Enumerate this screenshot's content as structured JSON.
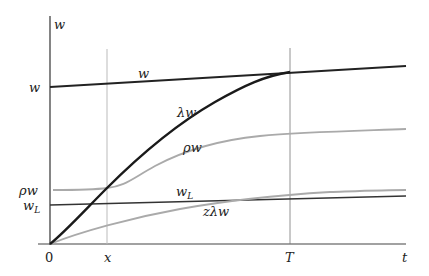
{
  "diagram": {
    "type": "wage-path diagram",
    "axes": {
      "y_axis_label": "w",
      "x_axis_label": "t",
      "origin_label": "0"
    },
    "x_ticks": [
      {
        "label": "x",
        "x": 107
      },
      {
        "label": "T",
        "x": 290
      }
    ],
    "y_ticks": [
      {
        "label": "w",
        "y": 87
      },
      {
        "label": "ρw",
        "y": 190
      },
      {
        "label": "w",
        "sub": "L",
        "y": 205
      }
    ],
    "curves": [
      {
        "name": "w",
        "label": "w",
        "color": "#222222",
        "style": "thick"
      },
      {
        "name": "lambda-w",
        "label": "λw",
        "color": "#1a1a1a",
        "style": "thick"
      },
      {
        "name": "rho-w",
        "label": "ρw",
        "color": "#aaaaaa",
        "style": "thin"
      },
      {
        "name": "w-L",
        "label": "w",
        "sub": "L",
        "color": "#333333",
        "style": "thin"
      },
      {
        "name": "z-lambda-w",
        "label": "zλw",
        "color": "#aaaaaa",
        "style": "thin"
      }
    ],
    "labels": {
      "y_axis_top": "w",
      "y_tick_w": "w",
      "y_tick_rho": "ρw",
      "y_tick_wL_base": "w",
      "y_tick_wL_sub": "L",
      "origin": "0",
      "tick_x": "x",
      "tick_T": "T",
      "axis_t": "t",
      "curve_w": "w",
      "curve_lambda": "λw",
      "curve_rho": "ρw",
      "curve_wL_base": "w",
      "curve_wL_sub": "L",
      "curve_zlambda": "zλw"
    }
  }
}
